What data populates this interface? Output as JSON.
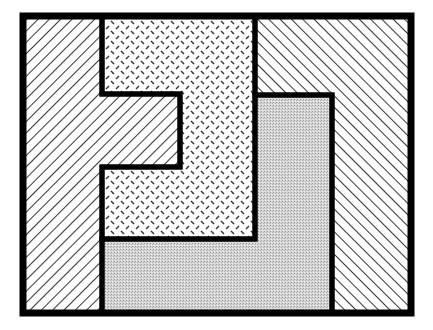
{
  "diagram": {
    "canvas": {
      "width": 433,
      "height": 330,
      "background": "#ffffff"
    },
    "frame": {
      "x": 23,
      "y": 16,
      "width": 388,
      "height": 297,
      "stroke": "#000000",
      "stroke_width": 6
    },
    "regions": [
      {
        "id": "left",
        "pattern": "diagonal-hatch-forward",
        "description": "Forward-slash diagonal lines; hook shape with notch extending right",
        "points": "23,16 102,16 102,94 180,94 180,167 102,167 102,313 23,313"
      },
      {
        "id": "top-middle",
        "pattern": "dashes",
        "description": "Small diagonal dash marks (dotted texture)",
        "points": "102,16 255,16 255,239 102,239 102,167 180,167 180,94 102,94"
      },
      {
        "id": "bottom-l",
        "pattern": "gray-stipple",
        "description": "Light gray stippled fill; L-shape",
        "points": "255,95 332,95 332,313 102,313 102,239 255,239"
      },
      {
        "id": "right",
        "pattern": "diagonal-hatch-backward",
        "description": "Back-slash diagonal lines; inverted L shape",
        "points": "255,16 411,16 411,313 332,313 332,95 255,95"
      }
    ],
    "colors": {
      "stroke": "#000000",
      "hatch": "#000000",
      "gray_fill": "#c8c8c8",
      "background": "#ffffff"
    }
  }
}
